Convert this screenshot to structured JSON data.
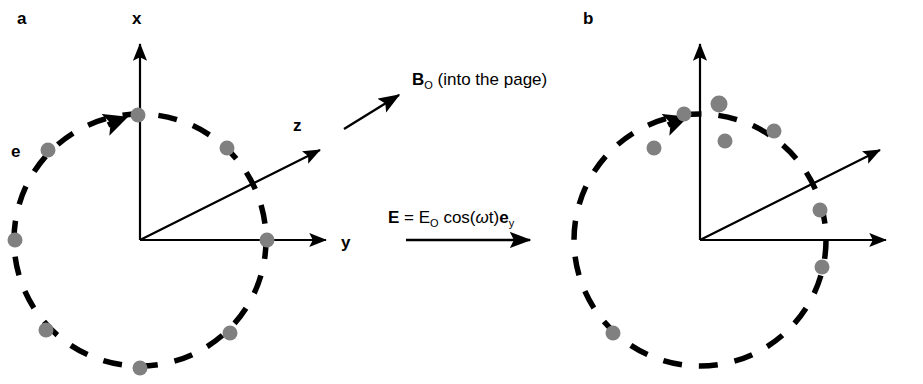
{
  "figure": {
    "width": 923,
    "height": 384,
    "background": "#ffffff",
    "ink_color": "#000000",
    "dot_color": "#808080"
  },
  "panels": [
    {
      "id": "panel-a",
      "label": "a",
      "label_pos": {
        "x": 17,
        "y": 22
      },
      "origin": {
        "x": 140,
        "y": 240
      },
      "radius": 126,
      "circle_style": "dashed",
      "axes": [
        {
          "name": "x",
          "label": "x",
          "tip": {
            "x": 140,
            "y": 38
          },
          "label_pos": {
            "x": 137,
            "y": 22
          }
        },
        {
          "name": "y",
          "label": "y",
          "tip": {
            "x": 333,
            "y": 240
          },
          "label_pos": {
            "x": 341,
            "y": 248
          }
        },
        {
          "name": "z",
          "label": "z",
          "tip": {
            "x": 326,
            "y": 144
          },
          "label_pos": {
            "x": 293,
            "y": 127
          }
        }
      ],
      "charge_label": "e",
      "charge_label_pos": {
        "x": 11,
        "y": 155
      },
      "rotation_arrow": {
        "angle_deg": 107,
        "direction": "counterclockwise"
      },
      "dots": [
        {
          "x": 138,
          "y": 115,
          "r": 7.5,
          "on_circle": true
        },
        {
          "x": 227,
          "y": 148,
          "r": 7.5,
          "on_circle": true
        },
        {
          "x": 48,
          "y": 150,
          "r": 7.5,
          "on_circle": true
        },
        {
          "x": 15,
          "y": 240,
          "r": 7.5,
          "on_circle": true
        },
        {
          "x": 267,
          "y": 240,
          "r": 7.5,
          "on_circle": true
        },
        {
          "x": 46,
          "y": 330,
          "r": 7.5,
          "on_circle": true
        },
        {
          "x": 230,
          "y": 333,
          "r": 7.5,
          "on_circle": true
        },
        {
          "x": 140,
          "y": 368,
          "r": 7.5,
          "on_circle": true
        }
      ]
    },
    {
      "id": "panel-b",
      "label": "b",
      "label_pos": {
        "x": 583,
        "y": 22
      },
      "origin": {
        "x": 700,
        "y": 240
      },
      "radius": 126,
      "circle_style": "dashed",
      "axes": [
        {
          "name": "x",
          "label": "",
          "tip": {
            "x": 700,
            "y": 38
          },
          "label_pos": {
            "x": 697,
            "y": 22
          }
        },
        {
          "name": "y",
          "label": "",
          "tip": {
            "x": 893,
            "y": 240
          },
          "label_pos": {
            "x": 901,
            "y": 248
          }
        },
        {
          "name": "z",
          "label": "",
          "tip": {
            "x": 886,
            "y": 144
          },
          "label_pos": {
            "x": 853,
            "y": 127
          }
        }
      ],
      "charge_label": "",
      "rotation_arrow": {
        "angle_deg": 100,
        "direction": "counterclockwise"
      },
      "dots": [
        {
          "x": 684,
          "y": 114,
          "r": 7.5,
          "on_circle": true
        },
        {
          "x": 719,
          "y": 104,
          "r": 8.5,
          "on_circle": false
        },
        {
          "x": 725,
          "y": 141,
          "r": 7.5,
          "on_circle": false
        },
        {
          "x": 654,
          "y": 148,
          "r": 7.5,
          "on_circle": false
        },
        {
          "x": 774,
          "y": 131,
          "r": 7.5,
          "on_circle": true
        },
        {
          "x": 820,
          "y": 210,
          "r": 7.5,
          "on_circle": true
        },
        {
          "x": 822,
          "y": 267,
          "r": 7.5,
          "on_circle": true
        },
        {
          "x": 613,
          "y": 333,
          "r": 7.5,
          "on_circle": true
        }
      ]
    }
  ],
  "annotations": {
    "magnetic_field": {
      "name": "B0-into-the-page",
      "symbol": "B",
      "subscript": "O",
      "description": "(into the page)",
      "text_pos": {
        "x": 412,
        "y": 85
      },
      "arrow": {
        "x1": 344,
        "y1": 129,
        "x2": 403,
        "y2": 92
      }
    },
    "electric_field": {
      "name": "E-field-equation",
      "lhs": "E",
      "equals": "=",
      "amplitude": "E",
      "amplitude_sub": "O",
      "cos_open": "cos(",
      "omega": "ω",
      "time": "t)",
      "unit_vector": "e",
      "unit_vector_sub": "y",
      "text_pos": {
        "x": 388,
        "y": 223
      },
      "arrow": {
        "x1": 406,
        "y1": 240,
        "x2": 534,
        "y2": 240
      }
    }
  }
}
